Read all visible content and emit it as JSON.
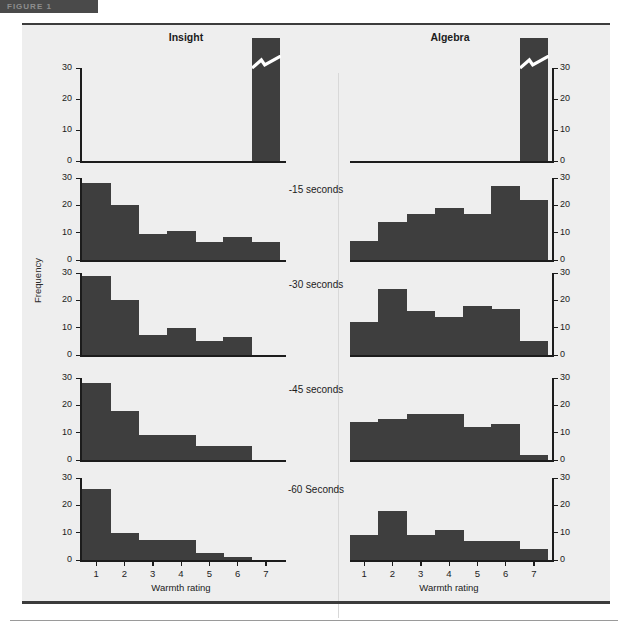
{
  "header": {
    "tab_text": "FIGURE 1",
    "tab_color": "#4a4a4a"
  },
  "figure": {
    "background": "#eeeeee",
    "bar_color": "#3e3e3e",
    "axis_color": "#1c1c1c",
    "columns": [
      {
        "key": "insight",
        "title": "Insight"
      },
      {
        "key": "algebra",
        "title": "Algebra"
      }
    ],
    "y_axis_label": "Frequency",
    "x_axis_label": "Warmth rating",
    "x_tick_labels": [
      "1",
      "2",
      "3",
      "4",
      "5",
      "6",
      "7"
    ],
    "y_tick_labels": [
      "0",
      "10",
      "20",
      "30"
    ],
    "row_labels": [
      "",
      "-15 seconds",
      "-30 seconds",
      "-45 seconds",
      "-60 Seconds"
    ]
  },
  "chart_data": {
    "type": "bar",
    "xlabel": "Warmth rating",
    "ylabel": "Frequency",
    "categories": [
      "1",
      "2",
      "3",
      "4",
      "5",
      "6",
      "7"
    ],
    "ylim": [
      0,
      30
    ],
    "yticks": [
      0,
      10,
      20,
      30
    ],
    "grid": false,
    "legend_position": "none",
    "panels": [
      {
        "row_label": "",
        "axis_break": true,
        "series": [
          {
            "name": "Insight",
            "values": [
              0,
              0,
              0,
              0,
              0,
              0,
              42
            ]
          },
          {
            "name": "Algebra",
            "values": [
              0,
              0,
              0,
              0,
              0,
              0,
              42
            ]
          }
        ]
      },
      {
        "row_label": "-15 seconds",
        "axis_break": false,
        "series": [
          {
            "name": "Insight",
            "values": [
              28,
              20,
              9.5,
              10.5,
              6.5,
              8.5,
              6.5
            ]
          },
          {
            "name": "Algebra",
            "values": [
              7,
              14,
              17,
              19,
              17,
              27,
              22
            ]
          }
        ]
      },
      {
        "row_label": "-30 seconds",
        "axis_break": false,
        "series": [
          {
            "name": "Insight",
            "values": [
              29,
              20,
              7.5,
              10,
              5,
              6.5,
              0
            ]
          },
          {
            "name": "Algebra",
            "values": [
              12,
              24,
              16,
              14,
              18,
              17,
              5
            ]
          }
        ]
      },
      {
        "row_label": "-45 seconds",
        "axis_break": false,
        "series": [
          {
            "name": "Insight",
            "values": [
              28,
              18,
              9,
              9,
              5,
              5,
              0
            ]
          },
          {
            "name": "Algebra",
            "values": [
              14,
              15,
              17,
              17,
              12,
              13,
              2
            ]
          }
        ]
      },
      {
        "row_label": "-60 Seconds",
        "axis_break": false,
        "series": [
          {
            "name": "Insight",
            "values": [
              26,
              10,
              7.5,
              7.5,
              2.5,
              1,
              0
            ]
          },
          {
            "name": "Algebra",
            "values": [
              9,
              18,
              9,
              11,
              7,
              7,
              4
            ]
          }
        ]
      }
    ]
  }
}
